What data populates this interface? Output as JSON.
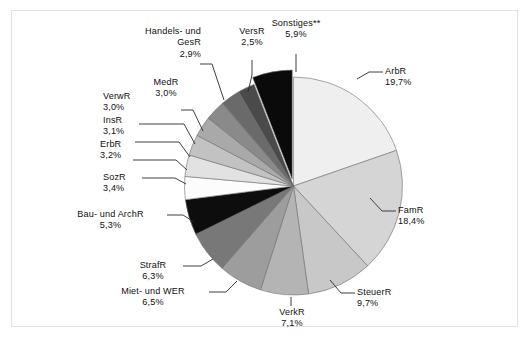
{
  "chart_data": {
    "type": "pie",
    "title": "",
    "subtitle": "",
    "xlabel": "",
    "ylabel": "",
    "legend_position": "none",
    "grid": false,
    "units": "percent",
    "decimal_separator": ",",
    "start_angle_deg": 0,
    "direction": "clockwise",
    "exploded_slices": [
      "Sonstiges**"
    ],
    "categories": [
      "ArbR",
      "FamR",
      "SteuerR",
      "VerkR",
      "Miet- und WER",
      "StrafR",
      "Bau- und ArchR",
      "SozR",
      "ErbR",
      "InsR",
      "VerwR",
      "MedR",
      "Handels- und GesR",
      "VersR",
      "Sonstiges**"
    ],
    "values": [
      19.7,
      18.4,
      9.7,
      7.1,
      6.5,
      6.3,
      5.3,
      3.4,
      3.2,
      3.1,
      3.0,
      3.0,
      2.9,
      2.5,
      5.9
    ],
    "value_labels": [
      "19,7%",
      "18,4%",
      "9,7%",
      "7,1%",
      "6,5%",
      "6,3%",
      "5,3%",
      "3,4%",
      "3,2%",
      "3,1%",
      "3,0%",
      "3,0%",
      "2,9%",
      "2,5%",
      "5,9%"
    ],
    "colors": [
      "#efefef",
      "#d5d5d5",
      "#c8c8c8",
      "#b4b4b4",
      "#9d9d9d",
      "#787878",
      "#0d0d0d",
      "#fcfcfc",
      "#e2e2e2",
      "#c2c2c2",
      "#a9a9a9",
      "#8a8a8a",
      "#6a6a6a",
      "#4a4a4a",
      "#0a0a0a"
    ]
  },
  "slices": [
    {
      "name": "ArbR",
      "percent": "19,7%"
    },
    {
      "name": "FamR",
      "percent": "18,4%"
    },
    {
      "name": "SteuerR",
      "percent": "9,7%"
    },
    {
      "name": "VerkR",
      "percent": "7,1%"
    },
    {
      "name": "Miet- und WER",
      "percent": "6,5%"
    },
    {
      "name": "StrafR",
      "percent": "6,3%"
    },
    {
      "name": "Bau- und ArchR",
      "percent": "5,3%"
    },
    {
      "name": "SozR",
      "percent": "3,4%"
    },
    {
      "name": "ErbR",
      "percent": "3,2%"
    },
    {
      "name": "InsR",
      "percent": "3,1%"
    },
    {
      "name": "VerwR",
      "percent": "3,0%"
    },
    {
      "name": "MedR",
      "percent": "3,0%"
    },
    {
      "name": "Handels- und",
      "percent": "2,9%",
      "name2": "GesR"
    },
    {
      "name": "VersR",
      "percent": "2,5%"
    },
    {
      "name": "Sonstiges**",
      "percent": "5,9%"
    }
  ]
}
